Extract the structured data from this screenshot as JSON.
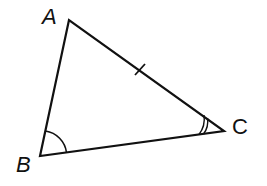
{
  "diagram": {
    "type": "triangle",
    "vertices": [
      {
        "label": "A",
        "x": 69,
        "y": 20,
        "italic": true
      },
      {
        "label": "B",
        "x": 40,
        "y": 156,
        "italic": true
      },
      {
        "label": "C",
        "x": 224,
        "y": 131,
        "italic": false
      }
    ],
    "marks": {
      "side_tick": "AC",
      "angle_single_arc": "B",
      "angle_double_arc": "C"
    },
    "stroke_color": "#111111"
  }
}
